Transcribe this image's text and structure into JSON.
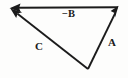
{
  "figure": {
    "background_color": "#fdfdfc",
    "stroke_color": "#1b1b1b",
    "labels": {
      "minus_b": "−B",
      "minus_sign": "−",
      "b": "B",
      "a": "A",
      "c": "C"
    },
    "vectors": [
      {
        "name": "minus-B",
        "label": "−B",
        "from": [
          118,
          7
        ],
        "to": [
          10,
          8
        ],
        "direction": "left",
        "arrowhead_at": "to"
      },
      {
        "name": "A",
        "label": "A",
        "from": [
          88,
          69
        ],
        "to": [
          118,
          7
        ],
        "direction": "up-right",
        "arrowhead_at": "to"
      },
      {
        "name": "C",
        "label": "C",
        "from": [
          88,
          69
        ],
        "to": [
          10,
          8
        ],
        "direction": "up-left",
        "arrowhead_at": "to"
      }
    ],
    "vertices": {
      "top_left": [
        10,
        8
      ],
      "top_right": [
        118,
        7
      ],
      "bottom": [
        88,
        69
      ]
    }
  }
}
